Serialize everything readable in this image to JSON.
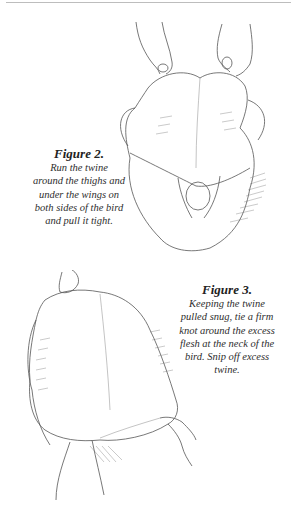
{
  "page": {
    "figures": [
      {
        "id": "figure-2",
        "title": "Figure 2.",
        "caption": "Run the twine around the thighs and under the wings on both sides of the bird and pull it tight.",
        "caption_lines": [
          "Run the twine",
          "around the thighs and",
          "under the wings on",
          "both sides of the bird",
          "and pull it tight."
        ],
        "illustration": "hands-pulling-twine-around-poultry-icon"
      },
      {
        "id": "figure-3",
        "title": "Figure 3.",
        "caption": "Keeping the twine pulled snug, tie a firm knot around the excess flesh at the neck of the bird. Snip off excess twine.",
        "caption_lines": [
          "Keeping the twine",
          "pulled snug, tie a firm",
          "knot around the excess",
          "flesh at the neck of the",
          "bird. Snip off excess",
          "twine."
        ],
        "illustration": "hands-tying-knot-at-neck-of-poultry-icon"
      }
    ]
  }
}
